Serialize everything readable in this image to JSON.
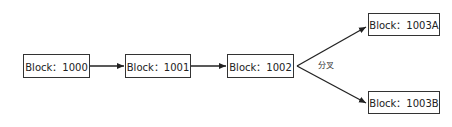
{
  "diagram": {
    "blocks": [
      {
        "id": "b1000",
        "label": "Block：1000"
      },
      {
        "id": "b1001",
        "label": "Block：1001"
      },
      {
        "id": "b1002",
        "label": "Block：1002"
      },
      {
        "id": "b1003a",
        "label": "Block：1003A"
      },
      {
        "id": "b1003b",
        "label": "Block：1003B"
      }
    ],
    "fork_label": "分叉",
    "edges": [
      {
        "from": "b1000",
        "to": "b1001"
      },
      {
        "from": "b1001",
        "to": "b1002"
      },
      {
        "from": "b1002",
        "to": "b1003a"
      },
      {
        "from": "b1002",
        "to": "b1003b"
      }
    ],
    "colors": {
      "line": "#222222",
      "border": "#333333"
    }
  }
}
